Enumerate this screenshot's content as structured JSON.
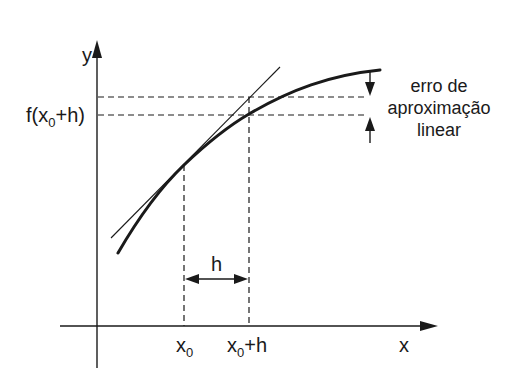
{
  "diagram": {
    "axes": {
      "x_label": "x",
      "y_label": "y"
    },
    "labels": {
      "f_x0_h_prefix": "f(x",
      "f_x0_h_sub": "0",
      "f_x0_h_suffix": "+h)",
      "x0_main": "x",
      "x0_sub": "0",
      "x0h_main": "x",
      "x0h_sub": "0",
      "x0h_suffix": "+h",
      "h": "h",
      "error_line1": "erro de",
      "error_line2": "aproximação",
      "error_line3": "linear"
    },
    "elements": [
      "curve f(x) (concave down)",
      "tangent line at x0",
      "dashed horizontal at tangent value at x0+h",
      "dashed horizontal at f(x0+h)",
      "dashed vertical at x0",
      "dashed vertical at x0+h",
      "double arrow h between x0 and x0+h",
      "error arrows between the two dashed horizontals"
    ]
  }
}
